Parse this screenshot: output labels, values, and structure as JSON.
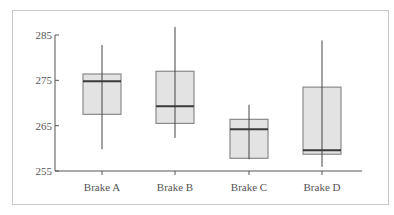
{
  "chart_data": {
    "type": "box",
    "title": "",
    "xlabel": "",
    "ylabel": "",
    "ylim": [
      255,
      285
    ],
    "yticks": [
      255,
      265,
      275,
      285
    ],
    "grid": false,
    "legend": null,
    "categories": [
      "Brake A",
      "Brake B",
      "Brake C",
      "Brake D"
    ],
    "series": [
      {
        "name": "Brake A",
        "whisker_low": 259.8,
        "q1": 267.5,
        "median": 274.8,
        "q3": 276.4,
        "whisker_high": 282.8
      },
      {
        "name": "Brake B",
        "whisker_low": 262.3,
        "q1": 265.5,
        "median": 269.3,
        "q3": 277.0,
        "whisker_high": 286.8
      },
      {
        "name": "Brake C",
        "whisker_low": 257.6,
        "q1": 257.8,
        "median": 264.2,
        "q3": 266.4,
        "whisker_high": 269.6
      },
      {
        "name": "Brake D",
        "whisker_low": 255.9,
        "q1": 258.7,
        "median": 259.6,
        "q3": 273.5,
        "whisker_high": 283.8
      }
    ]
  },
  "style": {
    "box_fill": "#e3e3e3",
    "box_stroke": "#8a8a8a",
    "median_color": "#3a3a3a",
    "whisker_color": "#444444",
    "axis_color": "#555555",
    "frame_color": "#c9c9c9"
  }
}
